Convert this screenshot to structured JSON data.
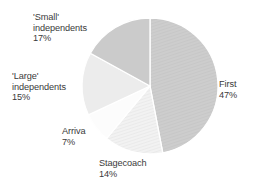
{
  "chart_data": {
    "type": "pie",
    "title": "",
    "subtitle": "",
    "xlabel": "",
    "ylabel": "",
    "legend_position": "none",
    "grid": false,
    "unit": "%",
    "start_angle_deg": 0,
    "direction": "clockwise",
    "categories": [
      "First",
      "Stagecoach",
      "Arriva",
      "'Large' independents",
      "'Small' independents"
    ],
    "values": [
      47,
      14,
      7,
      15,
      17
    ],
    "slices": [
      {
        "name": "First",
        "value": 47,
        "value_label": "47%",
        "color": "#c9c9c9",
        "pattern": "diagonal-hatch",
        "start_deg": 0,
        "end_deg": 169.2
      },
      {
        "name": "Stagecoach",
        "value": 14,
        "value_label": "14%",
        "color": "#ededed",
        "pattern": "diagonal-hatch",
        "start_deg": 169.2,
        "end_deg": 219.6
      },
      {
        "name": "Arriva",
        "value": 7,
        "value_label": "7%",
        "color": "#fcfcfc",
        "pattern": "solid",
        "start_deg": 219.6,
        "end_deg": 244.8
      },
      {
        "name": "'Large' independents",
        "value": 15,
        "value_label": "15%",
        "color": "#ececec",
        "pattern": "solid",
        "start_deg": 244.8,
        "end_deg": 298.8
      },
      {
        "name": "'Small' independents",
        "value": 17,
        "value_label": "17%",
        "color": "#cbcbcb",
        "pattern": "solid",
        "start_deg": 298.8,
        "end_deg": 360
      }
    ]
  },
  "labels": {
    "small_independents": {
      "line1": "'Small'",
      "line2": "independents",
      "percent": "17%"
    },
    "large_independents": {
      "line1": "'Large'",
      "line2": "independents",
      "percent": "15%"
    },
    "arriva": {
      "line1": "Arriva",
      "percent": "7%"
    },
    "stagecoach": {
      "line1": "Stagecoach",
      "percent": "14%"
    },
    "first": {
      "line1": "First",
      "percent": "47%"
    }
  },
  "style": {
    "background": "#ffffff",
    "text_color": "#3a3a3a",
    "separator_color": "#ffffff"
  }
}
